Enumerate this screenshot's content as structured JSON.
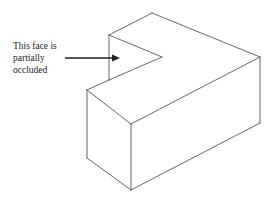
{
  "diagram": {
    "annotation": {
      "lines": [
        "This face is",
        "partially",
        "occluded"
      ]
    },
    "colors": {
      "stroke": "#555555",
      "arrow": "#222222",
      "text": "#222222",
      "background": "#ffffff"
    },
    "shape": "L-shaped block (isometric view)"
  }
}
